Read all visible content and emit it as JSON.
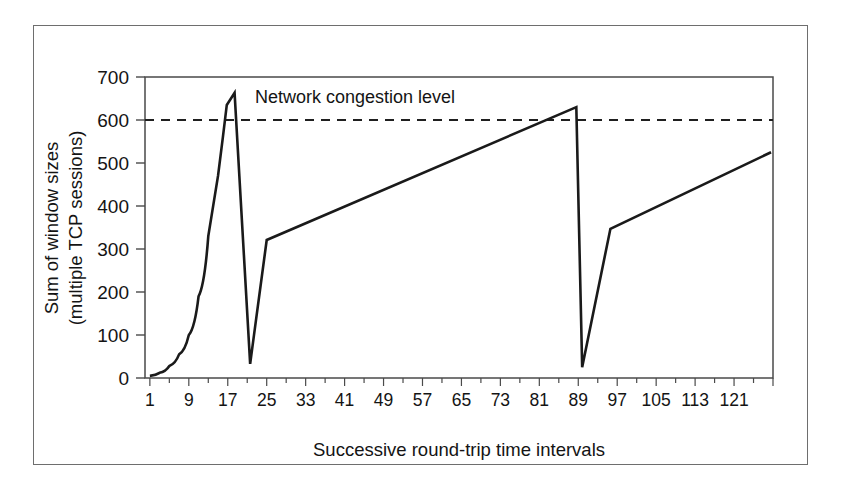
{
  "figure": {
    "background_color": "#ffffff",
    "frame_color": "#6e6e6e",
    "line_color": "#1a1a1a"
  },
  "chart_data": {
    "type": "line",
    "title": "",
    "subtitle": "",
    "xlabel": "Successive round-trip time intervals",
    "ylabel": "Sum of window sizes\n(multiple TCP sessions)",
    "ylabel_line1": "Sum of window sizes",
    "ylabel_line2": "(multiple TCP sessions)",
    "xlim": [
      0,
      129
    ],
    "ylim": [
      0,
      700
    ],
    "xticks": [
      1,
      9,
      17,
      25,
      33,
      41,
      49,
      57,
      65,
      73,
      81,
      89,
      97,
      105,
      113,
      121
    ],
    "xtick_labels": [
      "1",
      "9",
      "17",
      "25",
      "33",
      "41",
      "49",
      "57",
      "65",
      "73",
      "81",
      "89",
      "97",
      "105",
      "113",
      "121"
    ],
    "xticks_unlabeled": [
      129
    ],
    "yticks": [
      0,
      100,
      200,
      300,
      400,
      500,
      600,
      700
    ],
    "ytick_labels": [
      "0",
      "100",
      "200",
      "300",
      "400",
      "500",
      "600",
      "700"
    ],
    "grid": false,
    "legend": null,
    "annotations": [
      {
        "name": "network-congestion-level",
        "text": "Network congestion level",
        "x": 41,
        "y": 648,
        "kind": "text"
      }
    ],
    "threshold": {
      "name": "congestion-threshold",
      "label": "Network congestion level",
      "value": 600,
      "style": "dashed",
      "x_start": 0,
      "x_end": 129
    },
    "series": [
      {
        "name": "Sum of window sizes",
        "style": "solid",
        "points": [
          [
            1,
            5
          ],
          [
            3,
            12
          ],
          [
            5,
            28
          ],
          [
            7,
            55
          ],
          [
            9,
            100
          ],
          [
            11,
            190
          ],
          [
            13,
            330
          ],
          [
            15,
            470
          ],
          [
            16,
            560
          ],
          [
            16.8,
            635
          ],
          [
            18.4,
            663
          ],
          [
            21.6,
            33
          ],
          [
            25,
            321
          ],
          [
            88.6,
            630
          ],
          [
            89.8,
            25
          ],
          [
            95.6,
            347
          ],
          [
            128.6,
            525
          ]
        ]
      }
    ]
  }
}
